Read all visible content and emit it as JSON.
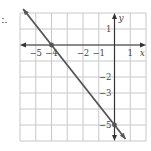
{
  "chart_data": {
    "type": "line",
    "title": "",
    "xlabel": "x",
    "ylabel": "y",
    "xlim": [
      -6,
      2
    ],
    "ylim": [
      -6,
      2
    ],
    "grid": true,
    "x_tick_labels": [
      "−5",
      "−4",
      "−2",
      "−1",
      "1"
    ],
    "x_ticks": [
      -5,
      -4,
      -2,
      -1,
      1
    ],
    "y_tick_labels": [
      "1",
      "−2",
      "−3",
      "−5"
    ],
    "y_ticks": [
      1,
      -2,
      -3,
      -5
    ],
    "series": [
      {
        "name": "line",
        "x": [
          -6,
          -4,
          0,
          1.2
        ],
        "y": [
          2.5,
          0,
          -5,
          -6.5
        ],
        "marked_points": [
          {
            "x": -4,
            "y": 0
          },
          {
            "x": 0,
            "y": -5
          }
        ],
        "equation": "y = -5/4 x - 5",
        "color": "#555555"
      }
    ],
    "colors": {
      "grid": "#c8c8c8",
      "axes": "#333333",
      "line": "#555555"
    }
  }
}
